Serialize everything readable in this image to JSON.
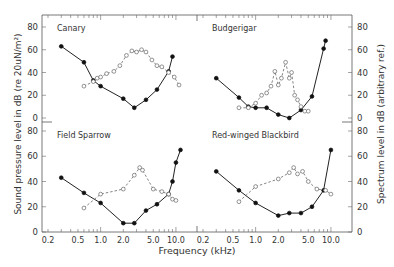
{
  "chart_data": [
    {
      "type": "line",
      "title": "Canary",
      "xlabel": "Frequency (kHz)",
      "ylabel": "Sound pressure level in dB (re 20uN/m²)",
      "ylabel_right": "Spectrum level in dB (arbitrary ref.)",
      "xscale": "log",
      "xlim": [
        0.2,
        12.5
      ],
      "ylim": [
        0,
        80
      ],
      "series": [
        {
          "name": "Audiogram threshold (filled)",
          "style": "solid-filled",
          "x": [
            0.3,
            0.6,
            0.8,
            1.0,
            2.0,
            2.8,
            4.0,
            5.6,
            8.0,
            9.0
          ],
          "y": [
            63,
            49,
            33,
            28,
            17,
            9,
            16,
            25,
            41,
            54
          ]
        },
        {
          "name": "Vocalization spectrum (open)",
          "style": "dashed-open",
          "x": [
            0.6,
            0.8,
            0.9,
            1.0,
            1.2,
            1.5,
            1.8,
            2.2,
            2.6,
            3.0,
            3.5,
            4.0,
            4.8,
            5.6,
            6.5,
            8.0,
            9.5,
            11.0
          ],
          "y": [
            28,
            32,
            35,
            36,
            39,
            41,
            46,
            55,
            59,
            58,
            60,
            58,
            51,
            46,
            45,
            40,
            36,
            29
          ]
        }
      ]
    },
    {
      "type": "line",
      "title": "Budgerigar",
      "xscale": "log",
      "xlim": [
        0.2,
        12.5
      ],
      "ylim": [
        0,
        80
      ],
      "series": [
        {
          "name": "Audiogram threshold (filled)",
          "style": "solid-filled",
          "x": [
            0.3,
            0.6,
            0.8,
            1.0,
            1.4,
            2.0,
            2.8,
            4.0,
            5.6,
            8.0,
            8.5
          ],
          "y": [
            35,
            18,
            10,
            9,
            9,
            3,
            0,
            7,
            19,
            61,
            68
          ]
        },
        {
          "name": "Vocalization spectrum (open)",
          "style": "dashed-open",
          "x": [
            0.6,
            0.8,
            1.0,
            1.2,
            1.4,
            1.6,
            1.8,
            2.0,
            2.2,
            2.5,
            2.8,
            3.0,
            3.3,
            3.6,
            4.0,
            4.5,
            5.0
          ],
          "y": [
            9,
            9,
            13,
            20,
            22,
            28,
            41,
            29,
            35,
            49,
            35,
            40,
            20,
            16,
            10,
            6,
            6
          ]
        }
      ]
    },
    {
      "type": "line",
      "title": "Field Sparrow",
      "xscale": "log",
      "xlim": [
        0.2,
        12.5
      ],
      "ylim": [
        0,
        80
      ],
      "series": [
        {
          "name": "Audiogram threshold (filled)",
          "style": "solid-filled",
          "x": [
            0.3,
            0.6,
            1.0,
            2.0,
            2.8,
            4.0,
            5.6,
            8.0,
            9.0,
            10.0,
            11.5
          ],
          "y": [
            43,
            31,
            23,
            7,
            7,
            17,
            22,
            30,
            40,
            55,
            65
          ]
        },
        {
          "name": "Vocalization spectrum (open)",
          "style": "dashed-open",
          "x": [
            0.6,
            1.0,
            2.0,
            2.8,
            3.3,
            3.6,
            5.0,
            6.5,
            8.0,
            9.0,
            10.0
          ],
          "y": [
            19,
            30,
            34,
            45,
            51,
            49,
            34,
            32,
            30,
            26,
            25
          ]
        }
      ]
    },
    {
      "type": "line",
      "title": "Red-winged Blackbird",
      "xscale": "log",
      "xlim": [
        0.2,
        12.5
      ],
      "ylim": [
        0,
        80
      ],
      "series": [
        {
          "name": "Audiogram threshold (filled)",
          "style": "solid-filled",
          "x": [
            0.3,
            0.6,
            1.0,
            2.0,
            2.8,
            4.0,
            5.6,
            8.0,
            10.0
          ],
          "y": [
            48,
            33,
            23,
            13,
            15,
            15,
            20,
            33,
            65
          ]
        },
        {
          "name": "Vocalization spectrum (open)",
          "style": "dashed-open",
          "x": [
            0.6,
            1.0,
            2.0,
            2.8,
            3.2,
            3.6,
            4.2,
            5.0,
            6.5,
            8.5,
            10.0
          ],
          "y": [
            24,
            36,
            42,
            47,
            51,
            46,
            48,
            40,
            34,
            33,
            30
          ]
        }
      ]
    }
  ],
  "axes": {
    "x_ticks": [
      "0.2",
      "0.5",
      "1.0",
      "2.0",
      "5.0",
      "10.0"
    ],
    "y_ticks": [
      "0",
      "20",
      "40",
      "60",
      "80"
    ],
    "xlabel": "Frequency (kHz)",
    "ylabel_left": "Sound pressure level in dB (re 20uN/m²)",
    "ylabel_right": "Spectrum level in dB (arbitrary ref.)"
  },
  "panels": {
    "tl": "Canary",
    "tr": "Budgerigar",
    "bl": "Field Sparrow",
    "br": "Red-winged Blackbird"
  }
}
